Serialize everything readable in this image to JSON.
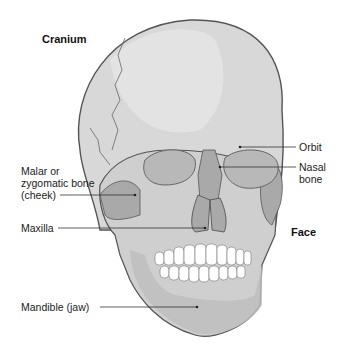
{
  "diagram": {
    "colors": {
      "cranium": "#d8d8d8",
      "cranium_highlight": "#e6e6e6",
      "outline": "#555555",
      "face_bone": "#a9a9a9",
      "orbit": "#b8b8b8",
      "teeth": "#ffffff",
      "background": "#ffffff"
    },
    "region_labels": {
      "cranium": "Cranium",
      "face": "Face"
    },
    "labels": {
      "orbit": "Orbit",
      "nasal_bone": "Nasal\nbone",
      "malar": "Malar or\nzygomatic bone\n(cheek)",
      "maxilla": "Maxilla",
      "mandible": "Mandible (jaw)"
    }
  }
}
